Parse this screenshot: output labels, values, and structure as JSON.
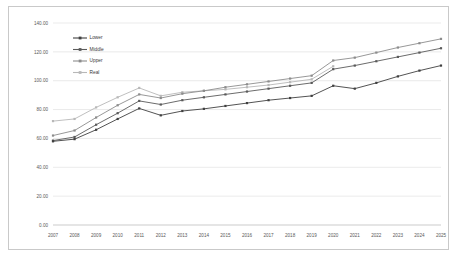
{
  "chart_data": {
    "type": "line",
    "title": "",
    "xlabel": "",
    "ylabel": "",
    "categories": [
      "2007",
      "2008",
      "2009",
      "2010",
      "2011",
      "2012",
      "2013",
      "2014",
      "2015",
      "2016",
      "2017",
      "2018",
      "2019",
      "2020",
      "2021",
      "2022",
      "2023",
      "2024",
      "2025"
    ],
    "x": [
      2007,
      2008,
      2009,
      2010,
      2011,
      2012,
      2013,
      2014,
      2015,
      2016,
      2017,
      2018,
      2019,
      2020,
      2021,
      2022,
      2023,
      2024,
      2025
    ],
    "ylim": [
      0,
      140
    ],
    "ytick_step": 20,
    "ytick_labels": [
      "0.00",
      "20.00",
      "40.00",
      "60.00",
      "80.00",
      "100.00",
      "120.00",
      "140.00"
    ],
    "ytick_values": [
      0,
      20,
      40,
      60,
      80,
      100,
      120,
      140
    ],
    "grid": true,
    "legend_position": "top-left",
    "markers": true,
    "series": [
      {
        "name": "Lower",
        "color": "#404040",
        "values": [
          58.0,
          59.5,
          66.0,
          73.5,
          80.8,
          76.0,
          79.0,
          80.5,
          82.5,
          84.5,
          86.5,
          88.0,
          89.5,
          96.5,
          94.5,
          98.5,
          103.0,
          107.0,
          110.5
        ]
      },
      {
        "name": "Middle",
        "color": "#5a5a5a",
        "values": [
          58.5,
          61.0,
          69.5,
          77.5,
          86.0,
          83.5,
          86.5,
          88.5,
          90.5,
          92.5,
          94.5,
          96.5,
          98.5,
          108.0,
          110.5,
          113.5,
          116.5,
          119.5,
          122.5
        ]
      },
      {
        "name": "Upper",
        "color": "#8c8c8c",
        "values": [
          62.0,
          65.5,
          74.5,
          83.0,
          90.5,
          88.0,
          91.0,
          93.0,
          95.5,
          97.5,
          99.5,
          101.5,
          103.5,
          114.0,
          116.0,
          119.5,
          123.0,
          126.0,
          129.0
        ]
      },
      {
        "name": "Real",
        "color": "#b8b8b8",
        "values": [
          72.0,
          73.5,
          81.5,
          88.5,
          95.0,
          89.5,
          92.0,
          93.0,
          94.0,
          95.5,
          97.0,
          99.0,
          101.0,
          110.0,
          null,
          null,
          null,
          null,
          null
        ]
      }
    ]
  }
}
